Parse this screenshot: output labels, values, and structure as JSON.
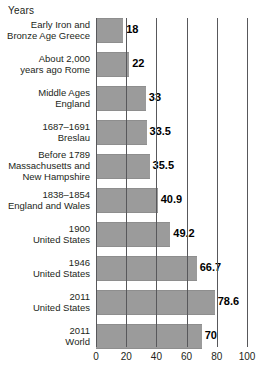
{
  "chart_data": {
    "type": "bar",
    "orientation": "horizontal",
    "title": "",
    "xlabel": "",
    "ylabel": "Years",
    "axis_title": "Years",
    "grid": true,
    "legend": "none",
    "xlim": [
      0,
      100
    ],
    "xticks": [
      0,
      20,
      40,
      60,
      80,
      100
    ],
    "xtick_labels": [
      "0",
      "20",
      "40",
      "60",
      "80",
      "100"
    ],
    "categories": [
      "Early Iron and\nBronze Age Greece",
      "About 2,000\nyears ago Rome",
      "Middle Ages\nEngland",
      "1687–1691\nBreslau",
      "Before 1789\nMassachusetts and\nNew Hampshire",
      "1838–1854\nEngland and Wales",
      "1900\nUnited States",
      "1946\nUnited States",
      "2011\nUnited States",
      "2011\nWorld"
    ],
    "values": [
      18,
      22,
      33,
      33.5,
      35.5,
      40.9,
      49.2,
      66.7,
      78.6,
      70
    ],
    "value_labels": [
      "18",
      "22",
      "33",
      "33.5",
      "35.5",
      "40.9",
      "49.2",
      "66.7",
      "78.6",
      "70"
    ],
    "colors": {
      "bar_fill": "#9b9b9b",
      "gridline": "#58585b",
      "text": "#231f20",
      "value_text": "#000000",
      "background": "#ffffff"
    }
  }
}
